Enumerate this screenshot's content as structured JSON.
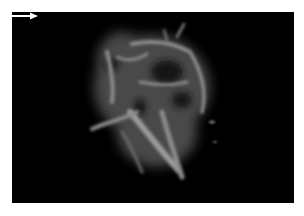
{
  "image": {
    "description": "Grayscale 3D power Doppler rendering of a vascular mass with arrow annotation",
    "background_color": "#000000",
    "page_background": "#ffffff",
    "annotations": [
      {
        "type": "arrow",
        "direction": "right",
        "color": "#ffffff"
      }
    ]
  }
}
